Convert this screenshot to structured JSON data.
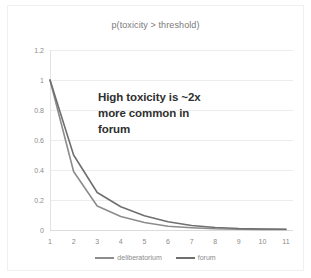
{
  "chart_data": {
    "type": "line",
    "title": "p(toxicity > threshold)",
    "xlabel": "",
    "ylabel": "",
    "x": [
      1,
      2,
      3,
      4,
      5,
      6,
      7,
      8,
      9,
      10,
      11
    ],
    "xlim": [
      1,
      11
    ],
    "ylim": [
      0,
      1.2
    ],
    "grid": true,
    "legend_position": "bottom-center",
    "y_ticks": [
      "0",
      "0.2",
      "0.4",
      "0.6",
      "0.8",
      "1",
      "1.2"
    ],
    "y_tick_values": [
      0,
      0.2,
      0.4,
      0.6,
      0.8,
      1,
      1.2
    ],
    "x_ticks": [
      "1",
      "2",
      "3",
      "4",
      "5",
      "6",
      "7",
      "8",
      "9",
      "10",
      "11"
    ],
    "series": [
      {
        "name": "deliberatorium",
        "color": "#8c8c8c",
        "values": [
          1.0,
          0.39,
          0.16,
          0.09,
          0.05,
          0.025,
          0.015,
          0.008,
          0.005,
          0.004,
          0.003
        ]
      },
      {
        "name": "forum",
        "color": "#6f6f6f",
        "values": [
          1.0,
          0.5,
          0.25,
          0.155,
          0.095,
          0.055,
          0.03,
          0.017,
          0.01,
          0.007,
          0.005
        ]
      }
    ],
    "annotations": [
      {
        "lines": [
          "High toxicity is ~2x",
          "more common in",
          "forum"
        ],
        "color": "#2f2f2f"
      }
    ]
  },
  "annotation": {
    "line1": "High toxicity is ~2x",
    "line2": "more common in",
    "line3": "forum"
  },
  "legend": {
    "items": [
      {
        "label": "deliberatorium"
      },
      {
        "label": "forum"
      }
    ]
  },
  "colors": {
    "series_deliberatorium": "#8c8c8c",
    "series_forum": "#6f6f6f",
    "gridline": "#ececed",
    "tick_text": "#8b8b8b",
    "title_text": "#7a7a7a",
    "annotation_text": "#2f2f2f",
    "card_background": "#ffffff",
    "card_border": "#f0f0f0"
  }
}
